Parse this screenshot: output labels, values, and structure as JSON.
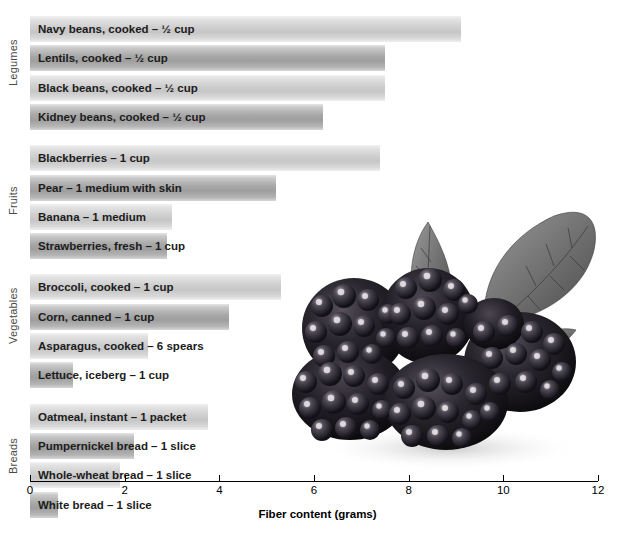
{
  "chart_data": {
    "type": "bar",
    "orientation": "horizontal",
    "title": "",
    "xlabel": "Fiber content (grams)",
    "ylabel": "",
    "xlim": [
      0,
      12
    ],
    "xticks": [
      0,
      2,
      4,
      6,
      8,
      10,
      12
    ],
    "grid": false,
    "legend": "none",
    "groups": [
      {
        "name": "Legumes",
        "items": [
          {
            "label": "Navy beans, cooked – ½ cup",
            "value": 9.1,
            "shade": "light"
          },
          {
            "label": "Lentils, cooked – ½ cup",
            "value": 7.5,
            "shade": "dark"
          },
          {
            "label": "Black beans, cooked – ½ cup",
            "value": 7.5,
            "shade": "light"
          },
          {
            "label": "Kidney beans, cooked – ½ cup",
            "value": 6.2,
            "shade": "dark"
          }
        ]
      },
      {
        "name": "Fruits",
        "items": [
          {
            "label": "Blackberries – 1 cup",
            "value": 7.4,
            "shade": "light"
          },
          {
            "label": "Pear – 1 medium with skin",
            "value": 5.2,
            "shade": "dark"
          },
          {
            "label": "Banana – 1 medium",
            "value": 3.0,
            "shade": "light"
          },
          {
            "label": "Strawberries, fresh – 1 cup",
            "value": 2.9,
            "shade": "dark"
          }
        ]
      },
      {
        "name": "Vegetables",
        "items": [
          {
            "label": "Broccoli, cooked – 1 cup",
            "value": 5.3,
            "shade": "light"
          },
          {
            "label": "Corn, canned – 1 cup",
            "value": 4.2,
            "shade": "dark"
          },
          {
            "label": "Asparagus, cooked – 6 spears",
            "value": 2.5,
            "shade": "light"
          },
          {
            "label": "Lettuce, iceberg – 1 cup",
            "value": 0.9,
            "shade": "dark"
          }
        ]
      },
      {
        "name": "Breads",
        "items": [
          {
            "label": "Oatmeal, instant – 1 packet",
            "value": 3.75,
            "shade": "light"
          },
          {
            "label": "Pumpernickel bread – 1 slice",
            "value": 2.2,
            "shade": "dark"
          },
          {
            "label": "Whole-wheat bread – 1 slice",
            "value": 1.9,
            "shade": "light"
          },
          {
            "label": "White bread – 1 slice",
            "value": 0.6,
            "shade": "dark"
          }
        ]
      }
    ]
  },
  "image": {
    "name": "blackberries-photo",
    "description": "Cluster of blackberries with leaves"
  }
}
